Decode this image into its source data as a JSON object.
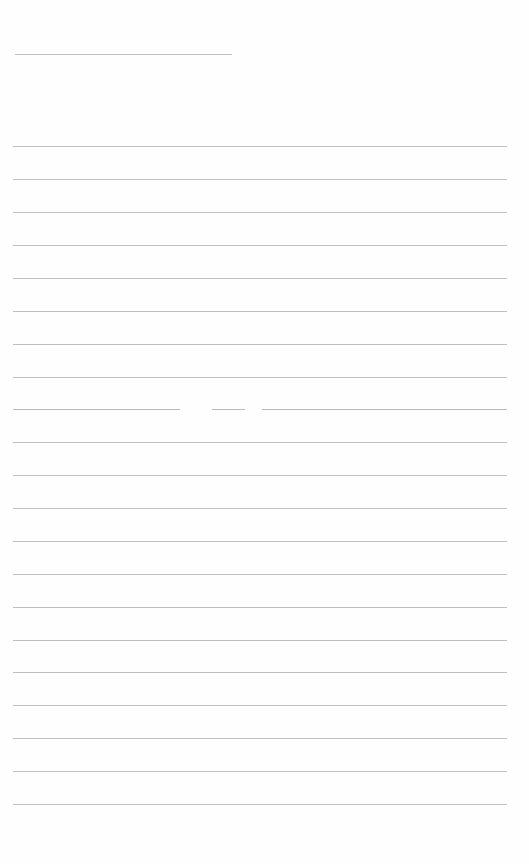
{
  "document": {
    "type": "blank lined page",
    "text": "",
    "title_line": {
      "y": 54,
      "x1": 15,
      "x2": 232
    },
    "ruled_lines": {
      "x1": 13,
      "x2": 507,
      "y_positions": [
        146,
        179,
        212,
        245,
        278,
        311,
        344,
        377,
        409,
        442,
        475,
        508,
        541,
        574,
        607,
        640,
        672,
        705,
        738,
        771,
        804
      ]
    },
    "broken_line": {
      "y": 409,
      "segments": [
        [
          13,
          180
        ],
        [
          212,
          245
        ],
        [
          262,
          507
        ]
      ]
    },
    "line_color": "#b9b9b9",
    "background_color": "#fefefe"
  }
}
